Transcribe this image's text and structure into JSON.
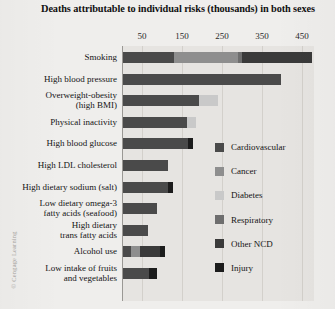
{
  "figure": {
    "title": "Deaths attributable to individual risks (thousands)\nin both sexes",
    "credit": "© Cengage Learning"
  },
  "colors": {
    "cardiovascular": "#4a4a4a",
    "cancer": "#8e8e8e",
    "diabetes": "#c9c9c9",
    "respiratory": "#6e6e6e",
    "other_ncd": "#3a3a3a",
    "injury": "#1c1c1c",
    "plot_background": "#e6e4e1",
    "page_background": "#efeeec",
    "gridline": "#d3d0cb",
    "axis": "#9a9894"
  },
  "legend": {
    "position": "inside-right",
    "items": [
      {
        "label": "Cardiovascular",
        "color": "#4a4a4a"
      },
      {
        "label": "Cancer",
        "color": "#8e8e8e"
      },
      {
        "label": "Diabetes",
        "color": "#c9c9c9"
      },
      {
        "label": "Respiratory",
        "color": "#6e6e6e"
      },
      {
        "label": "Other NCD",
        "color": "#3a3a3a"
      },
      {
        "label": "Injury",
        "color": "#1c1c1c"
      }
    ]
  },
  "axis": {
    "ticks": [
      {
        "label": "50",
        "value": 50
      },
      {
        "label": "150",
        "value": 150
      },
      {
        "label": "250",
        "value": 250
      },
      {
        "label": "350",
        "value": 350
      },
      {
        "label": "450",
        "value": 450
      }
    ],
    "min": 0,
    "max": 480,
    "grid": true
  },
  "chart_data": {
    "type": "bar",
    "orientation": "horizontal",
    "stacked": true,
    "title": "Deaths attributable to individual risks (thousands) in both sexes",
    "xlabel": "Deaths (thousands)",
    "ylabel": "",
    "xlim": [
      0,
      480
    ],
    "grid": true,
    "legend_position": "inside-right",
    "categories": [
      "Smoking",
      "High blood pressure",
      "Overweight-obesity (high BMI)",
      "Physical inactivity",
      "High blood glucose",
      "High LDL cholesterol",
      "High dietary sodium (salt)",
      "Low dietary omega-3 fatty acids (seafood)",
      "High dietary trans fatty acids",
      "Alcohol use",
      "Low intake of fruits and vegetables"
    ],
    "series": [
      {
        "name": "Cardiovascular",
        "color": "#4a4a4a",
        "values": [
          128,
          395,
          190,
          160,
          163,
          113,
          113,
          84,
          62,
          20,
          64
        ]
      },
      {
        "name": "Cancer",
        "color": "#8e8e8e",
        "values": [
          160,
          0,
          0,
          0,
          0,
          0,
          0,
          0,
          0,
          23,
          0
        ]
      },
      {
        "name": "Diabetes",
        "color": "#c9c9c9",
        "values": [
          0,
          0,
          48,
          22,
          0,
          0,
          0,
          0,
          0,
          0,
          0
        ]
      },
      {
        "name": "Respiratory",
        "color": "#6e6e6e",
        "values": [
          10,
          0,
          0,
          0,
          0,
          0,
          0,
          0,
          0,
          0,
          0
        ]
      },
      {
        "name": "Other NCD",
        "color": "#3a3a3a",
        "values": [
          175,
          0,
          0,
          0,
          0,
          0,
          0,
          0,
          0,
          50,
          0
        ]
      },
      {
        "name": "Injury",
        "color": "#1c1c1c",
        "values": [
          0,
          0,
          0,
          0,
          13,
          0,
          12,
          0,
          0,
          12,
          20
        ]
      }
    ],
    "totals": [
      473,
      395,
      238,
      182,
      176,
      113,
      125,
      84,
      62,
      105,
      84
    ]
  },
  "category_labels": [
    {
      "text": "Smoking"
    },
    {
      "text": "High blood pressure"
    },
    {
      "text": "Overweight-obesity\n(high BMI)"
    },
    {
      "text": "Physical inactivity"
    },
    {
      "text": "High blood glucose"
    },
    {
      "text": "High LDL cholesterol"
    },
    {
      "text": "High dietary sodium (salt)"
    },
    {
      "text": "Low dietary omega-3\nfatty acids (seafood)"
    },
    {
      "text": "High dietary\ntrans fatty acids"
    },
    {
      "text": "Alcohol use"
    },
    {
      "text": "Low intake of fruits\nand vegetables"
    }
  ]
}
